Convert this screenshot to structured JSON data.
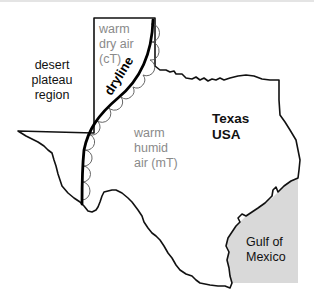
{
  "diagram": {
    "type": "map",
    "colors": {
      "border": "#111111",
      "dryline": "#000000",
      "bulges": "#555555",
      "gulf_fill": "#d9d9d9",
      "label_gray": "#8a8a8a",
      "label_dark": "#111111"
    },
    "labels": {
      "desert": [
        "desert",
        "plateau",
        "region"
      ],
      "dry_air": [
        "warm",
        "dry air",
        "(cT)"
      ],
      "dryline": "dryline",
      "humid_air": [
        "warm",
        "humid",
        "air (mT)"
      ],
      "state": [
        "Texas",
        "USA"
      ],
      "gulf": [
        "Gulf of",
        "Mexico"
      ]
    }
  }
}
